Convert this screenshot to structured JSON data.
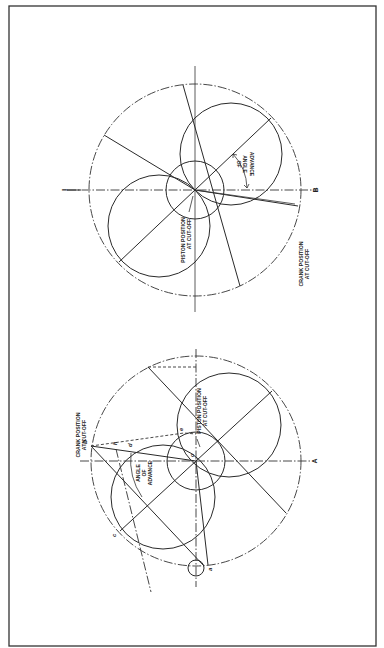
{
  "figure": {
    "orientation": "rotated-90-ccw",
    "diagrams": [
      {
        "id": "top",
        "labels": {
          "axis_end_left": "I",
          "axis_end_right": "B",
          "piston_line1": "PISTON POSITION",
          "piston_line2": "AT CUT-OFF",
          "crank_line1": "CRANK POSITION",
          "crank_line2": "AT CUT-OFF",
          "angle_line1": "ANGLE",
          "angle_line2": "OF",
          "angle_line3": "ADVANCE"
        }
      },
      {
        "id": "bottom",
        "labels": {
          "axis_end_right": "A",
          "crank_line1": "CRANK POSITION",
          "crank_line2": "AT CUT-OFF",
          "piston_line1": "PISTON POSITION",
          "piston_line2": "AT CUT-OFF",
          "angle_line1": "ANGLE",
          "angle_line2": "OF",
          "angle_line3": "ADVANCE",
          "point_b": "b",
          "point_c": "c",
          "point_d": "d",
          "point_e": "e",
          "point_h": "h",
          "point_o": "o",
          "point_a": "a",
          "point_f": "f"
        }
      }
    ]
  }
}
